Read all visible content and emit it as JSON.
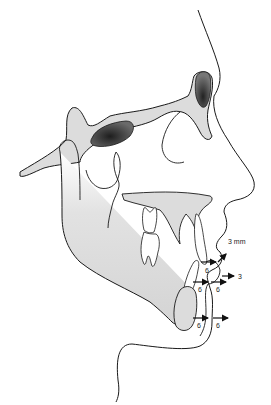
{
  "diagram": {
    "type": "cephalometric-tracing",
    "colors": {
      "bone_fill": "#dcdcdc",
      "outline": "#1a1a1a",
      "sinus_dark": "#3a3a3a",
      "background": "#ffffff"
    },
    "annotations": [
      {
        "id": "upper-lip-vertical",
        "label": "3 mm",
        "direction": "up-right"
      },
      {
        "id": "upper-lip",
        "label": "3",
        "direction": "right"
      },
      {
        "id": "upper-incisor-edge",
        "label": "6",
        "direction": "right"
      },
      {
        "id": "lower-incisor-bone",
        "label": "6",
        "direction": "right"
      },
      {
        "id": "lower-lip-soft",
        "label": "6",
        "direction": "right"
      },
      {
        "id": "chin-bone",
        "label": "6",
        "direction": "right"
      },
      {
        "id": "chin-soft",
        "label": "6",
        "direction": "right"
      }
    ]
  }
}
